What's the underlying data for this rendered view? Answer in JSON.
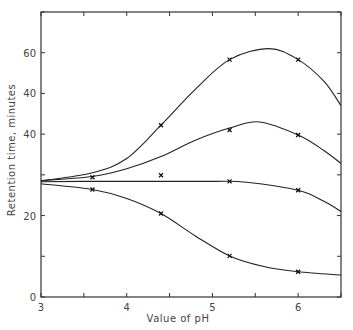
{
  "chart_data": {
    "type": "line",
    "title": "",
    "xlabel": "Value of pH",
    "ylabel": "Retention time, minutes",
    "xlim": [
      3,
      6.5
    ],
    "ylim": [
      0,
      70
    ],
    "x_ticks": [
      3,
      3.5,
      4,
      4.5,
      5,
      5.5,
      6,
      6.5
    ],
    "x_tick_labels": [
      {
        "value": 3,
        "label": "3"
      },
      {
        "value": 4,
        "label": "4"
      },
      {
        "value": 5,
        "label": "5"
      },
      {
        "value": 6,
        "label": "6"
      }
    ],
    "y_ticks": [
      0,
      10,
      20,
      30,
      40,
      50,
      60,
      70
    ],
    "y_tick_labels": [
      {
        "value": 0,
        "label": "0"
      },
      {
        "value": 20,
        "label": "20"
      },
      {
        "value": 40,
        "label": "40"
      },
      {
        "value": 50,
        "label": "40"
      },
      {
        "value": 60,
        "label": "60"
      }
    ],
    "grid": false,
    "legend": null,
    "series": [
      {
        "name": "curve-1",
        "curve": [
          [
            3,
            28.5
          ],
          [
            3.6,
            30.5
          ],
          [
            4,
            34
          ],
          [
            4.4,
            42.2
          ],
          [
            4.8,
            51
          ],
          [
            5.2,
            58.3
          ],
          [
            5.66,
            61
          ],
          [
            6.0,
            58.3
          ],
          [
            6.3,
            53
          ],
          [
            6.5,
            47
          ]
        ],
        "points": [
          [
            4.4,
            42.2
          ],
          [
            5.2,
            58.3
          ],
          [
            6.0,
            58.3
          ]
        ]
      },
      {
        "name": "curve-2",
        "curve": [
          [
            3,
            28.6
          ],
          [
            3.6,
            29.6
          ],
          [
            4,
            31.5
          ],
          [
            4.4,
            34.5
          ],
          [
            4.8,
            38.5
          ],
          [
            5.2,
            41.5
          ],
          [
            5.55,
            43
          ],
          [
            6.0,
            39.8
          ],
          [
            6.3,
            36
          ],
          [
            6.5,
            32.8
          ]
        ],
        "points": [
          [
            3.6,
            29.4
          ],
          [
            5.2,
            41
          ],
          [
            6.0,
            39.8
          ]
        ]
      },
      {
        "name": "curve-3",
        "curve": [
          [
            3,
            28.3
          ],
          [
            3.6,
            28.4
          ],
          [
            4.4,
            28.4
          ],
          [
            5.0,
            28.4
          ],
          [
            5.4,
            28.2
          ],
          [
            6.0,
            26.2
          ],
          [
            6.3,
            23.5
          ],
          [
            6.5,
            21
          ]
        ],
        "points": [
          [
            4.4,
            29.9
          ],
          [
            5.2,
            28.4
          ],
          [
            6.0,
            26.2
          ]
        ]
      },
      {
        "name": "curve-4",
        "curve": [
          [
            3,
            27.8
          ],
          [
            3.6,
            26.4
          ],
          [
            4,
            24.2
          ],
          [
            4.4,
            20.5
          ],
          [
            4.8,
            15
          ],
          [
            5.2,
            10.1
          ],
          [
            5.6,
            7.5
          ],
          [
            6.0,
            6.2
          ],
          [
            6.5,
            5.4
          ]
        ],
        "points": [
          [
            3.6,
            26.4
          ],
          [
            4.4,
            20.5
          ],
          [
            5.2,
            10.1
          ],
          [
            6.0,
            6.2
          ]
        ]
      }
    ]
  }
}
